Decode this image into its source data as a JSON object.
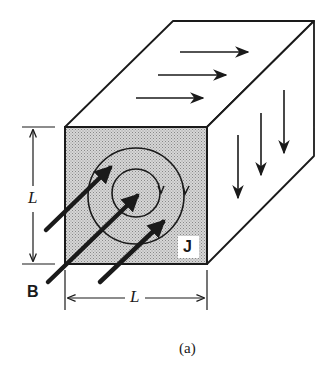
{
  "figure": {
    "caption": "(a)",
    "labels": {
      "height_dimension": "L",
      "width_dimension": "L",
      "magnetic_field": "B",
      "current_density": "J"
    },
    "elements": {
      "cube": "rectangular block with shaded front face",
      "top_face_arrows": 3,
      "side_face_arrows": 3,
      "circulation_loops": 2,
      "field_arrows": 3
    },
    "colors": {
      "stroke": "#1a1a1a",
      "front_face": "#c8c8c8",
      "background": "#ffffff"
    }
  }
}
